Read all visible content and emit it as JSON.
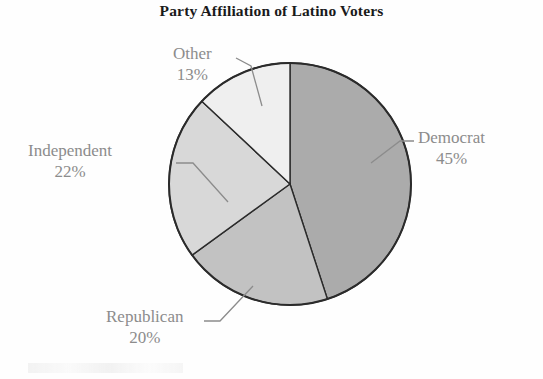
{
  "chart_data": {
    "type": "pie",
    "title": "Party Affiliation of Latino Voters",
    "categories": [
      "Democrat",
      "Republican",
      "Independent",
      "Other"
    ],
    "values": [
      45,
      20,
      22,
      13
    ],
    "value_suffix": "%",
    "labels": [
      {
        "name": "Democrat",
        "percent": "45%",
        "value": 45,
        "color": "#ababab",
        "start_angle": 0,
        "end_angle": 162
      },
      {
        "name": "Republican",
        "percent": "20%",
        "value": 20,
        "color": "#c2c2c2",
        "start_angle": 162,
        "end_angle": 234
      },
      {
        "name": "Independent",
        "percent": "22%",
        "value": 22,
        "color": "#d8d8d8",
        "start_angle": 234,
        "end_angle": 313.2
      },
      {
        "name": "Other",
        "percent": "13%",
        "value": 13,
        "color": "#efefef",
        "start_angle": 313.2,
        "end_angle": 360
      }
    ],
    "legend_position": "callout-labels",
    "grid": false,
    "xlabel": "",
    "ylabel": "",
    "start_angle_deg": 0,
    "direction": "clockwise",
    "outline_color": "#2b2b2b",
    "label_color": "#8c8c8c",
    "background": "#fefefe"
  }
}
